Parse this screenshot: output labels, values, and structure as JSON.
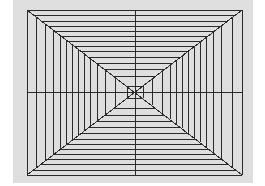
{
  "diagram": {
    "type": "perspective-tunnel",
    "canvas": {
      "width": 265,
      "height": 186,
      "background": "#ffffff"
    },
    "panel": {
      "x": 13,
      "y": 0,
      "width": 240,
      "height": 183,
      "fill": "#dedede"
    },
    "frame": {
      "x1": 27,
      "y1": 10,
      "x2": 242,
      "y2": 175
    },
    "center": {
      "x": 135,
      "y": 92
    },
    "inner": {
      "x1": 127,
      "y1": 86,
      "x2": 143,
      "y2": 98
    },
    "line_color": "#2a2a2a",
    "line_width": 1,
    "verticals_left": [
      27,
      36,
      45,
      53,
      60,
      66,
      72,
      78,
      84,
      90,
      97,
      105,
      115,
      127
    ],
    "verticals_right": [
      143,
      152,
      162,
      170,
      176,
      182,
      188,
      194,
      200,
      206,
      213,
      221,
      232,
      242
    ],
    "horizontals_top": [
      10,
      15,
      21,
      26,
      31,
      36,
      41,
      46,
      51,
      57,
      63,
      69,
      76,
      86
    ],
    "horizontals_bottom": [
      98,
      108,
      115,
      121,
      127,
      133,
      139,
      144,
      149,
      154,
      159,
      164,
      170,
      175
    ]
  }
}
